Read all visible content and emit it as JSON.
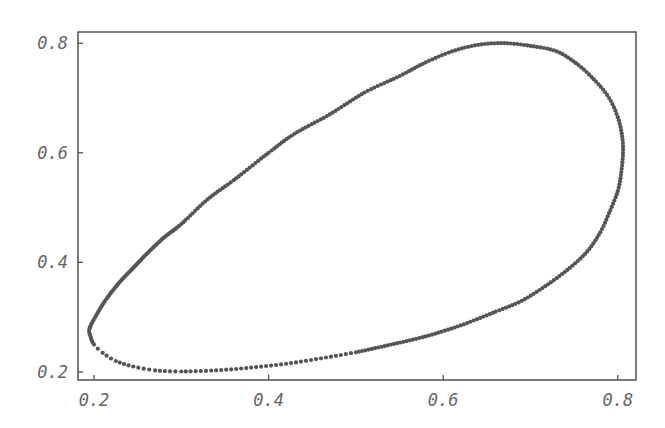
{
  "chart_data": {
    "type": "scatter",
    "title": "",
    "xlabel": "",
    "ylabel": "",
    "xlim": [
      0.18,
      0.82
    ],
    "ylim": [
      0.19,
      0.82
    ],
    "grid": false,
    "legend": null,
    "x_ticks": [
      "0.2",
      "0.4",
      "0.6",
      "0.8"
    ],
    "y_ticks": [
      "0.2",
      "0.4",
      "0.6",
      "0.8"
    ],
    "series": [
      {
        "name": "trajectory",
        "color": "#555555",
        "points": [
          [
            0.195,
            0.28
          ],
          [
            0.205,
            0.31
          ],
          [
            0.215,
            0.335
          ],
          [
            0.23,
            0.365
          ],
          [
            0.245,
            0.39
          ],
          [
            0.26,
            0.415
          ],
          [
            0.28,
            0.445
          ],
          [
            0.3,
            0.47
          ],
          [
            0.33,
            0.515
          ],
          [
            0.36,
            0.55
          ],
          [
            0.4,
            0.6
          ],
          [
            0.43,
            0.635
          ],
          [
            0.47,
            0.67
          ],
          [
            0.51,
            0.71
          ],
          [
            0.55,
            0.74
          ],
          [
            0.58,
            0.765
          ],
          [
            0.61,
            0.785
          ],
          [
            0.64,
            0.797
          ],
          [
            0.67,
            0.8
          ],
          [
            0.7,
            0.795
          ],
          [
            0.73,
            0.785
          ],
          [
            0.755,
            0.76
          ],
          [
            0.775,
            0.73
          ],
          [
            0.79,
            0.7
          ],
          [
            0.8,
            0.665
          ],
          [
            0.805,
            0.63
          ],
          [
            0.806,
            0.6
          ],
          [
            0.804,
            0.565
          ],
          [
            0.8,
            0.53
          ],
          [
            0.79,
            0.49
          ],
          [
            0.78,
            0.455
          ],
          [
            0.765,
            0.42
          ],
          [
            0.745,
            0.39
          ],
          [
            0.72,
            0.36
          ],
          [
            0.69,
            0.33
          ],
          [
            0.66,
            0.31
          ],
          [
            0.62,
            0.285
          ],
          [
            0.58,
            0.265
          ],
          [
            0.54,
            0.25
          ],
          [
            0.5,
            0.236
          ],
          [
            0.46,
            0.225
          ],
          [
            0.42,
            0.215
          ],
          [
            0.38,
            0.208
          ],
          [
            0.34,
            0.203
          ],
          [
            0.3,
            0.201
          ],
          [
            0.27,
            0.203
          ],
          [
            0.245,
            0.21
          ],
          [
            0.225,
            0.22
          ],
          [
            0.21,
            0.235
          ],
          [
            0.2,
            0.25
          ],
          [
            0.196,
            0.265
          ]
        ]
      }
    ]
  },
  "axes": {
    "x_ticks": [
      {
        "label": "0.2",
        "value": 0.2
      },
      {
        "label": "0.4",
        "value": 0.4
      },
      {
        "label": "0.6",
        "value": 0.6
      },
      {
        "label": "0.8",
        "value": 0.8
      }
    ],
    "y_ticks": [
      {
        "label": "0.2",
        "value": 0.2
      },
      {
        "label": "0.4",
        "value": 0.4
      },
      {
        "label": "0.6",
        "value": 0.6
      },
      {
        "label": "0.8",
        "value": 0.8
      }
    ]
  }
}
